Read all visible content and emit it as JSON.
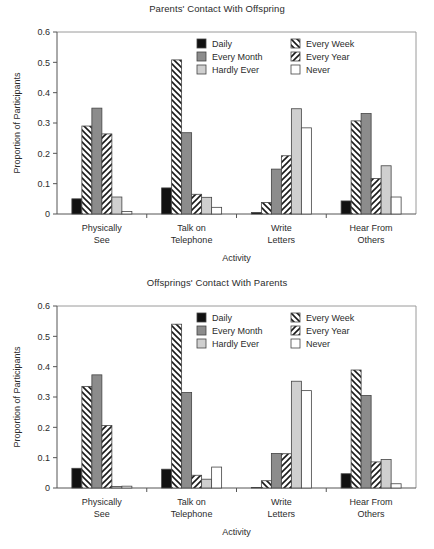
{
  "figure": {
    "background": "#ffffff",
    "panels": 2
  },
  "colors": {
    "daily": "#111111",
    "every_month": "#8c8c8c",
    "hardly_ever": "#cfcfcf",
    "never": "#ffffff",
    "hatch_stroke": "#1a1a1a",
    "outline": "#444444",
    "frame": "#9a9a9a",
    "text": "#2b2b2b"
  },
  "legend": {
    "position": "top-center-inside",
    "entries": [
      {
        "label": "Daily",
        "style": "solid-black",
        "color": "#111111"
      },
      {
        "label": "Every Week",
        "style": "hatch-backslash",
        "color": "#ffffff"
      },
      {
        "label": "Every Month",
        "style": "solid-dark-gray",
        "color": "#8c8c8c"
      },
      {
        "label": "Every Year",
        "style": "hatch-forwardslash",
        "color": "#ffffff"
      },
      {
        "label": "Hardly Ever",
        "style": "solid-light-gray",
        "color": "#cfcfcf"
      },
      {
        "label": "Never",
        "style": "solid-white",
        "color": "#ffffff"
      }
    ]
  },
  "chart_data": [
    {
      "type": "bar",
      "title": "Parents' Contact With Offspring",
      "xlabel": "Activity",
      "ylabel": "Proportion of Participants",
      "ylim": [
        0,
        0.6
      ],
      "yticks": [
        "0",
        "0.1",
        "0.2",
        "0.3",
        "0.4",
        "0.5",
        "0.6"
      ],
      "ytick_values": [
        0,
        0.1,
        0.2,
        0.3,
        0.4,
        0.5,
        0.6
      ],
      "grid": false,
      "legend_position": "inside-top-center",
      "categories": [
        "Physically See",
        "Talk on Telephone",
        "Write Letters",
        "Hear From Others"
      ],
      "category_lines": [
        [
          "Physically",
          "See"
        ],
        [
          "Talk on",
          "Telephone"
        ],
        [
          "Write",
          "Letters"
        ],
        [
          "Hear From",
          "Others"
        ]
      ],
      "series": [
        {
          "name": "Daily",
          "values": [
            0.05,
            0.086,
            0.005,
            0.043
          ]
        },
        {
          "name": "Every Week",
          "values": [
            0.29,
            0.508,
            0.038,
            0.307
          ]
        },
        {
          "name": "Every Month",
          "values": [
            0.349,
            0.268,
            0.148,
            0.331
          ]
        },
        {
          "name": "Every Year",
          "values": [
            0.264,
            0.065,
            0.192,
            0.117
          ]
        },
        {
          "name": "Hardly Ever",
          "values": [
            0.056,
            0.055,
            0.347,
            0.159
          ]
        },
        {
          "name": "Never",
          "values": [
            0.008,
            0.022,
            0.284,
            0.056
          ]
        }
      ]
    },
    {
      "type": "bar",
      "title": "Offsprings' Contact With Parents",
      "xlabel": "Activity",
      "ylabel": "Proportion of Participants",
      "ylim": [
        0,
        0.6
      ],
      "yticks": [
        "0",
        "0.1",
        "0.2",
        "0.3",
        "0.4",
        "0.5",
        "0.6"
      ],
      "ytick_values": [
        0,
        0.1,
        0.2,
        0.3,
        0.4,
        0.5,
        0.6
      ],
      "grid": false,
      "legend_position": "inside-top-center",
      "categories": [
        "Physically See",
        "Talk on Telephone",
        "Write Letters",
        "Hear From Others"
      ],
      "category_lines": [
        [
          "Physically",
          "See"
        ],
        [
          "Talk on",
          "Telephone"
        ],
        [
          "Write",
          "Letters"
        ],
        [
          "Hear From",
          "Others"
        ]
      ],
      "series": [
        {
          "name": "Daily",
          "values": [
            0.065,
            0.062,
            0.0,
            0.047
          ]
        },
        {
          "name": "Every Week",
          "values": [
            0.335,
            0.54,
            0.024,
            0.389
          ]
        },
        {
          "name": "Every Month",
          "values": [
            0.373,
            0.315,
            0.114,
            0.305
          ]
        },
        {
          "name": "Every Year",
          "values": [
            0.206,
            0.042,
            0.113,
            0.086
          ]
        },
        {
          "name": "Hardly Ever",
          "values": [
            0.005,
            0.029,
            0.352,
            0.094
          ]
        },
        {
          "name": "Never",
          "values": [
            0.006,
            0.069,
            0.321,
            0.014
          ]
        }
      ]
    }
  ]
}
